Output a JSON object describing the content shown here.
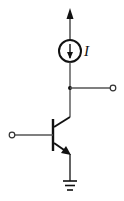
{
  "diagram": {
    "type": "circuit-schematic",
    "colors": {
      "stroke": "#111111",
      "wire": "#444444",
      "background": "#ffffff"
    },
    "components": {
      "current_source": {
        "label": "I",
        "direction": "down"
      },
      "transistor": {
        "kind": "NPN BJT"
      },
      "ground": {
        "kind": "ground"
      }
    },
    "terminals": {
      "supply": "up-arrow",
      "output": "open-circle-right",
      "input": "open-circle-left"
    }
  }
}
